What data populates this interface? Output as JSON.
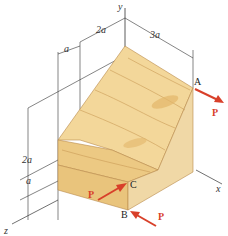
{
  "figure": {
    "axes": {
      "y": "y",
      "x": "x",
      "z": "z"
    },
    "dimensions": {
      "top_a": "a",
      "top_2a": "2a",
      "top_3a": "3a",
      "left_2a": "2a",
      "left_a": "a"
    },
    "points": {
      "A": "A",
      "B": "B",
      "C": "C"
    },
    "forces": {
      "at_A": "P",
      "at_C": "P",
      "at_B": "P"
    },
    "colors": {
      "wood_light": "#f3d79a",
      "wood_mid": "#e8c27a",
      "wood_dark": "#c99a55",
      "force": "#d8402a",
      "lines": "#333333"
    }
  }
}
